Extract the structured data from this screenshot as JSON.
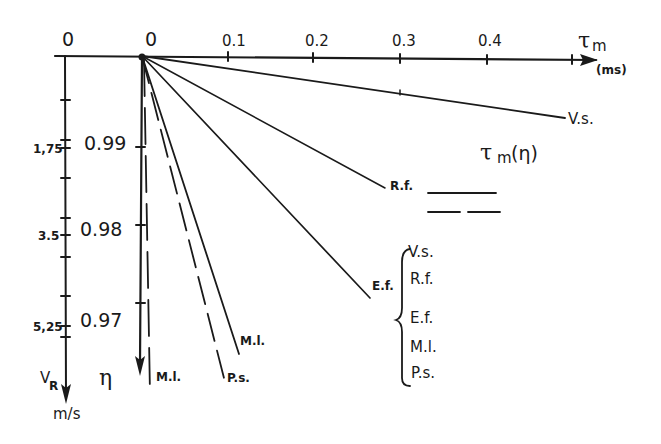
{
  "diagram": {
    "horizontal_axis": {
      "symbol": "τ",
      "subscript": "m",
      "unit": "(ms)",
      "ticks": [
        "0",
        "0.1",
        "0.2",
        "0.3",
        "0.4"
      ],
      "left_origin_label": "0"
    },
    "vr_axis": {
      "symbol": "V",
      "subscript": "R",
      "unit": "m/s",
      "ticks": [
        "1,75",
        "3.5",
        "5,25"
      ]
    },
    "eta_axis": {
      "symbol": "η",
      "ticks": [
        "0.99",
        "0.98",
        "0.97"
      ]
    },
    "lines": [
      {
        "label": "V.s.",
        "style": "solid"
      },
      {
        "label": "R.f.",
        "style": "solid"
      },
      {
        "label": "E.f.",
        "style": "solid"
      },
      {
        "label": "M.l.",
        "style": "solid"
      },
      {
        "label": "P.s.",
        "style": "dashed"
      },
      {
        "label": "M.l.",
        "style": "dashed"
      }
    ],
    "legend": {
      "title_symbol": "τ",
      "title_subscript": "m",
      "title_suffix": "(η)",
      "solid_sample": "solid",
      "dashed_sample": "dashed",
      "items": [
        "V.s.",
        "R.f.",
        "E.f.",
        "M.l.",
        "P.s."
      ]
    }
  }
}
